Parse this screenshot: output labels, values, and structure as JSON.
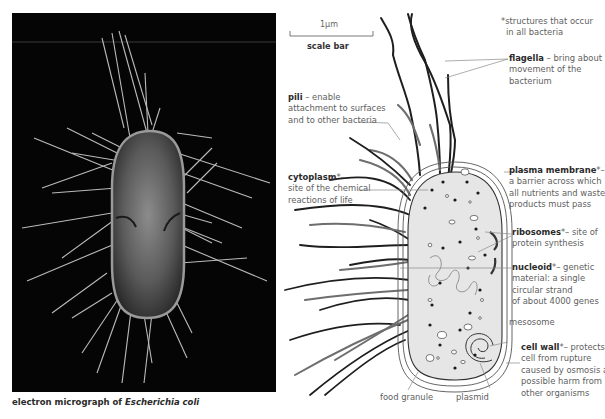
{
  "micrograph": {
    "caption_prefix": "electron micrograph of ",
    "caption_species": "Escherichia coli",
    "background_color": "#050505"
  },
  "scale_bar": {
    "value": "1µm",
    "label": "scale bar"
  },
  "footnote": {
    "line1": "*structures that occur",
    "line2": "in all bacteria"
  },
  "labels": {
    "flagella": {
      "term": "flagella",
      "desc1": " – bring about",
      "desc2": "movement of the",
      "desc3": "bacterium"
    },
    "pili": {
      "term": "pili",
      "desc1": " – enable",
      "desc2": "attachment to surfaces",
      "desc3": "and to other bacteria"
    },
    "cytoplasm": {
      "term": "cytoplasm",
      "mark": "*–",
      "desc2": "site of the chemical",
      "desc3": "reactions of life"
    },
    "plasma_membrane": {
      "term": "plasma membrane",
      "mark": "*–",
      "desc2": "a barrier across which",
      "desc3": "all nutrients and waste",
      "desc4": "products must pass"
    },
    "ribosomes": {
      "term": "ribosomes",
      "mark": "*– site of",
      "desc2": "protein synthesis"
    },
    "nucleoid": {
      "term": "nucleoid",
      "mark": "*– genetic",
      "desc2": "material: a single",
      "desc3": "circular strand",
      "desc4": "of about 4000 genes"
    },
    "mesosome": {
      "text": "mesosome"
    },
    "cell_wall": {
      "term": "cell wall",
      "mark": "*– protects",
      "desc2": "cell from rupture",
      "desc3": "caused by osmosis and",
      "desc4": "possible harm from",
      "desc5": "other organisms"
    },
    "food_granule": {
      "text": "food granule"
    },
    "plasmid": {
      "text": "plasmid"
    }
  },
  "colors": {
    "cytoplasm_fill": "#e6e6e6",
    "flagella_stroke": "#1e1e1e",
    "pili_stroke": "#6e6e6e",
    "leader_line": "#8a8a8a"
  }
}
